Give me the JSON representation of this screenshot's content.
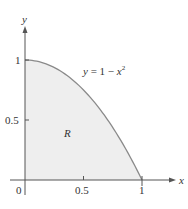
{
  "chart_data": {
    "type": "area",
    "title": "",
    "curve_label": "y = 1 − x²",
    "curve_label_parts": {
      "lhs": "y",
      "eq": " = 1 − ",
      "var": "x",
      "exp": "2"
    },
    "region_label": "R",
    "xlabel": "x",
    "ylabel": "y",
    "xlim": [
      0,
      1
    ],
    "ylim": [
      0,
      1
    ],
    "x_ticks": [
      "0",
      "0.5",
      "1"
    ],
    "y_ticks": [
      "0.5",
      "1"
    ],
    "origin_label": "0",
    "grid": false,
    "series": [
      {
        "name": "y = 1 - x^2",
        "x": [
          0,
          0.1,
          0.2,
          0.3,
          0.4,
          0.5,
          0.6,
          0.7,
          0.8,
          0.9,
          1.0
        ],
        "values": [
          1,
          0.99,
          0.96,
          0.91,
          0.84,
          0.75,
          0.64,
          0.51,
          0.36,
          0.19,
          0
        ]
      }
    ],
    "colors": {
      "fill": "#eeeeee",
      "curve": "#8a8a8a",
      "axis": "#555555",
      "text": "#333333"
    }
  }
}
